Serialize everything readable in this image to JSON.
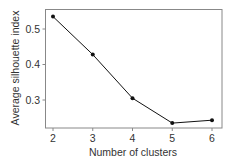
{
  "chart_data": {
    "type": "line",
    "title": "",
    "xlabel": "Number of clusters",
    "ylabel": "Average silhouette index",
    "x": [
      2,
      3,
      4,
      5,
      6
    ],
    "values": [
      0.535,
      0.428,
      0.305,
      0.235,
      0.243
    ],
    "series": [
      {
        "name": "Average silhouette index",
        "x": [
          2,
          3,
          4,
          5,
          6
        ],
        "values": [
          0.535,
          0.428,
          0.305,
          0.235,
          0.243
        ],
        "marker": "circle",
        "color": "#111111"
      }
    ],
    "xticks": [
      "2",
      "3",
      "4",
      "5",
      "6"
    ],
    "yticks": [
      "0.3",
      "0.4",
      "0.5"
    ],
    "ytick_values": [
      0.3,
      0.4,
      0.5
    ],
    "xlim": [
      1.8,
      6.25
    ],
    "ylim": [
      0.2165,
      0.5565
    ],
    "grid": false,
    "legend": null
  },
  "colors": {
    "line": "#111111",
    "axis": "#888888",
    "text": "#333333"
  }
}
